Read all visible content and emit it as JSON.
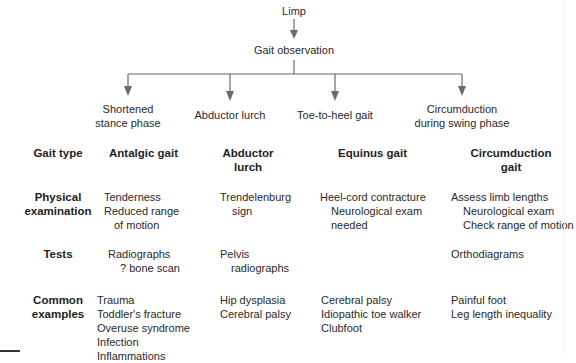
{
  "flow": {
    "root": "Limp",
    "observation": "Gait observation",
    "branches": [
      {
        "label_lines": [
          "Shortened",
          "stance phase"
        ]
      },
      {
        "label_lines": [
          "Abductor lurch"
        ]
      },
      {
        "label_lines": [
          "Toe-to-heel gait"
        ]
      },
      {
        "label_lines": [
          "Circumduction",
          "during swing phase"
        ]
      }
    ]
  },
  "rows": {
    "gait_type": {
      "label": "Gait type",
      "cells": [
        [
          "Antalgic gait"
        ],
        [
          "Abductor",
          "lurch"
        ],
        [
          "Equinus gait"
        ],
        [
          "Circumduction",
          "gait"
        ]
      ]
    },
    "physical_examination": {
      "label_lines": [
        "Physical",
        "examination"
      ],
      "cells": [
        [
          "Tenderness",
          "Reduced range",
          "of motion"
        ],
        [
          "Trendelenburg",
          "sign"
        ],
        [
          "Heel-cord contracture",
          "Neurological exam",
          "needed"
        ],
        [
          "Assess limb lengths",
          "Neurological exam",
          "Check range of motion"
        ]
      ]
    },
    "tests": {
      "label": "Tests",
      "cells": [
        [
          "Radiographs",
          "? bone scan"
        ],
        [
          "Pelvis",
          "radiographs"
        ],
        [],
        [
          "Orthodiagrams"
        ]
      ]
    },
    "common_examples": {
      "label_lines": [
        "Common",
        "examples"
      ],
      "cells": [
        [
          "Trauma",
          "Toddler's fracture",
          "Overuse syndrome",
          "Infection",
          "Inflammations"
        ],
        [
          "Hip dysplasia",
          "Cerebral palsy"
        ],
        [
          "Cerebral palsy",
          "Idiopathic toe walker",
          "Clubfoot"
        ],
        [
          "Painful foot",
          "Leg length inequality"
        ]
      ]
    }
  },
  "colors": {
    "line": "#6a6a6a",
    "text": "#2a2a2a",
    "background": "#ffffff"
  }
}
